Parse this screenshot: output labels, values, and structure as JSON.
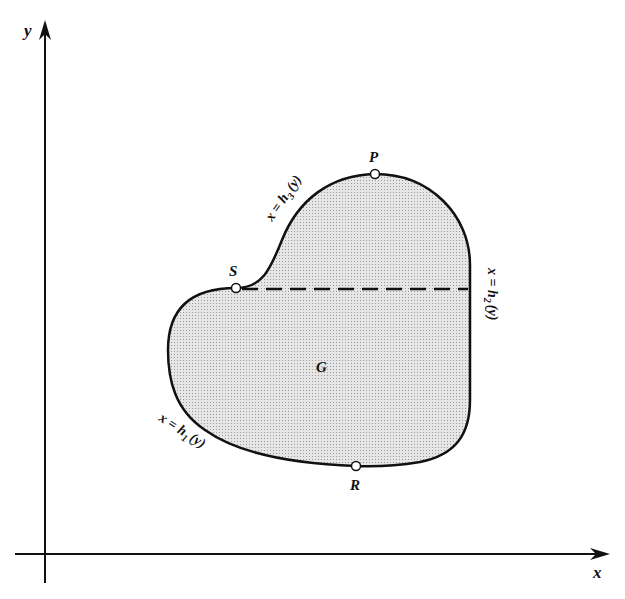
{
  "axes": {
    "x_label": "x",
    "y_label": "y"
  },
  "region": {
    "label": "G",
    "fill_color": "#dcdcdc",
    "stroke_color": "#111111"
  },
  "points": [
    {
      "name": "P",
      "label": "P"
    },
    {
      "name": "S",
      "label": "S"
    },
    {
      "name": "R",
      "label": "R"
    }
  ],
  "curves": {
    "h1": {
      "label_prefix": "x = h",
      "subscript": "1",
      "suffix": "(y)"
    },
    "h2": {
      "label_prefix": "x = h",
      "subscript": "2",
      "suffix": "(y)"
    },
    "h3": {
      "label_prefix": "x = h",
      "subscript": "3",
      "suffix": "(y)"
    }
  }
}
